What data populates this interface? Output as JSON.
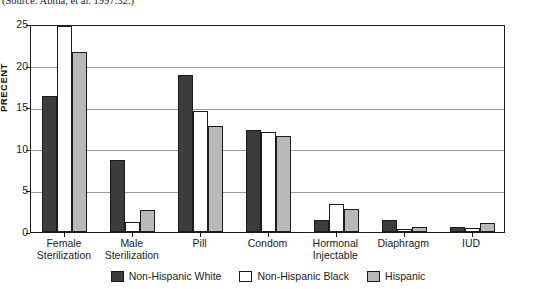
{
  "source_note": "(Source: Abma, et al. 1997:32.)",
  "chart_data": {
    "type": "bar",
    "title": "",
    "xlabel": "",
    "ylabel": "PRECENT",
    "ylim": [
      0,
      25
    ],
    "yticks": [
      0,
      5,
      10,
      15,
      20,
      25
    ],
    "ytick_labels": [
      "0",
      "5",
      "10",
      "15",
      "20",
      "25"
    ],
    "grid": true,
    "grid_axis": "y",
    "legend_position": "bottom",
    "categories": [
      "Female Sterilization",
      "Male Sterilization",
      "Pill",
      "Condom",
      "Hormonal Injectable",
      "Diaphragm",
      "IUD"
    ],
    "category_lines": [
      [
        "Female",
        "Sterilization"
      ],
      [
        "Male",
        "Sterilization"
      ],
      [
        "Pill"
      ],
      [
        "Condom"
      ],
      [
        "Hormonal",
        "Injectable"
      ],
      [
        "Diaphragm"
      ],
      [
        "IUD"
      ]
    ],
    "series": [
      {
        "name": "Non-Hispanic White",
        "color": "#3c3c3c",
        "values": [
          16.4,
          8.7,
          18.9,
          12.3,
          1.5,
          1.5,
          0.6
        ]
      },
      {
        "name": "Non-Hispanic Black",
        "color": "#ffffff",
        "values": [
          24.8,
          1.2,
          14.6,
          12.0,
          3.4,
          0.4,
          0.5
        ]
      },
      {
        "name": "Hispanic",
        "color": "#b9b9b9",
        "values": [
          21.6,
          2.6,
          12.7,
          11.5,
          2.8,
          0.6,
          1.1
        ]
      }
    ]
  }
}
